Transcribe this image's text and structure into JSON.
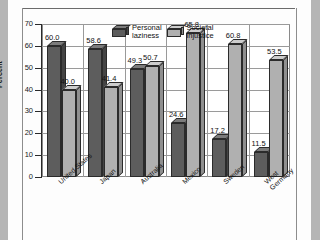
{
  "chart_data": {
    "type": "bar",
    "title": "",
    "xlabel": "",
    "ylabel": "Percent",
    "ylim": [
      0,
      70
    ],
    "yticks": [
      0,
      10,
      20,
      30,
      40,
      50,
      60,
      70
    ],
    "grid": true,
    "legend_position": "top-center",
    "categories": [
      "United States",
      "Japan",
      "Australia",
      "Mexico",
      "Sweden",
      "West Germany"
    ],
    "series": [
      {
        "name": "Personal laziness",
        "values": [
          60.0,
          58.6,
          49.3,
          24.6,
          17.2,
          11.5
        ]
      },
      {
        "name": "Societal injustice",
        "values": [
          40.0,
          41.4,
          50.7,
          65.8,
          60.8,
          53.5
        ]
      }
    ],
    "value_labels": [
      "60.0",
      "40.0",
      "58.6",
      "41.4",
      "49.3",
      "50.7",
      "24.6",
      "65.8",
      "17.2",
      "60.8",
      "11.5",
      "53.5"
    ]
  },
  "colors": {
    "series_dark": "#5d5d5d",
    "series_light": "#b0b0b0",
    "axis": "#2a2a2a",
    "grid": "#9a9a9a",
    "page": "#fdfdfd",
    "gutter": "#b5b5b5"
  }
}
